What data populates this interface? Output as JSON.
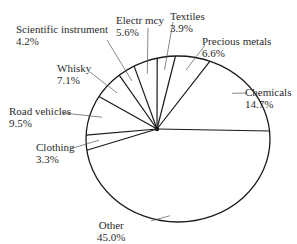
{
  "chart_data": {
    "type": "pie",
    "title": "",
    "slices": [
      {
        "label": "Chemicals",
        "value": 14.7,
        "display": "14.7%"
      },
      {
        "label": "Precious metals",
        "value": 6.6,
        "display": "6.6%"
      },
      {
        "label": "Textiles",
        "value": 3.9,
        "display": "3.9%"
      },
      {
        "label": "Electr mcy",
        "value": 5.6,
        "display": "5.6%"
      },
      {
        "label": "Scientific instrument",
        "value": 4.2,
        "display": "4.2%"
      },
      {
        "label": "Whisky",
        "value": 7.1,
        "display": "7.1%"
      },
      {
        "label": "Road vehicles",
        "value": 9.5,
        "display": "9.5%"
      },
      {
        "label": "Clothing",
        "value": 3.3,
        "display": "3.3%"
      },
      {
        "label": "Other",
        "value": 45.0,
        "display": "45.0%"
      }
    ],
    "legend": "none",
    "labels": "outside-with-leader-lines",
    "colors": {
      "stroke": "#1a1a1a",
      "fill": "#ffffff",
      "text": "#2b2b2b"
    }
  }
}
